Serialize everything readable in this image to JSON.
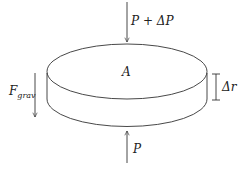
{
  "diagram": {
    "type": "free-body disc diagram",
    "element": {
      "shape": "cylindrical disc",
      "area_label": "A",
      "thickness_label": "Δr"
    },
    "forces": {
      "top": {
        "label": "P + ΔP",
        "direction": "down"
      },
      "bottom": {
        "label": "P",
        "direction": "up"
      },
      "gravity": {
        "label_main": "F",
        "label_sub": "grav",
        "direction": "down"
      }
    }
  },
  "colors": {
    "line": "#333333",
    "text": "#222222",
    "background": "#ffffff"
  }
}
